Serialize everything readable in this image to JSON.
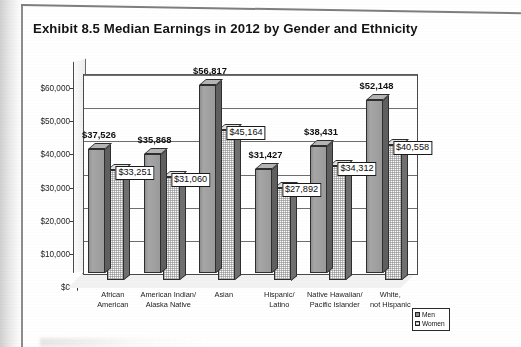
{
  "title": "Exhibit 8.5  Median Earnings in 2012 by Gender and Ethnicity",
  "legend": {
    "men_label": "Men",
    "women_label": "Women"
  },
  "chart_data": {
    "type": "bar",
    "title": "Exhibit 8.5  Median Earnings in 2012 by Gender and Ethnicity",
    "xlabel": "",
    "ylabel": "",
    "ylim": [
      0,
      60000
    ],
    "ytick_labels": [
      "$60,000",
      "$50,000",
      "$40,000",
      "$30,000",
      "$20,000",
      "$10,000",
      "$0"
    ],
    "ytick_values": [
      60000,
      50000,
      40000,
      30000,
      20000,
      10000,
      0
    ],
    "grid": true,
    "legend_position": "bottom-right",
    "categories": [
      "African American",
      "American Indian/ Alaska Native",
      "Asian",
      "Hispanic/ Latino",
      "Native Hawaiian/ Pacific Islander",
      "White, not Hispanic"
    ],
    "category_lines": [
      [
        "African",
        "American"
      ],
      [
        "American Indian/",
        "Alaska Native"
      ],
      [
        "Asian",
        ""
      ],
      [
        "Hispanic/",
        "Latino"
      ],
      [
        "Native Hawaiian/",
        "Pacific Islander"
      ],
      [
        "White,",
        "not Hispanic"
      ]
    ],
    "series": [
      {
        "name": "Men",
        "values": [
          37526,
          35868,
          56817,
          31427,
          38431,
          52148
        ],
        "labels": [
          "$37,526",
          "$35,868",
          "$56,817",
          "$31,427",
          "$38,431",
          "$52,148"
        ]
      },
      {
        "name": "Women",
        "values": [
          33251,
          31060,
          45164,
          27892,
          34312,
          40558
        ],
        "labels": [
          "$33,251",
          "$31,060",
          "$45,164",
          "$27,892",
          "$34,312",
          "$40,558"
        ]
      }
    ]
  }
}
